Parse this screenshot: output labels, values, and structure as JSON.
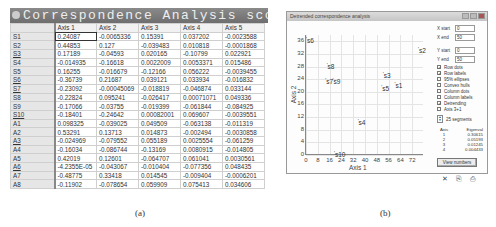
{
  "panel_a": {
    "title": "Correspondence Analysis scores",
    "columns": [
      "",
      "Axis 1",
      "Axis 2",
      "Axis 3",
      "Axis 4",
      "Axis 5"
    ],
    "rows": [
      {
        "label": "S1",
        "values": [
          "0.24087",
          "-0.0065336",
          "0.15391",
          "0.037202",
          "-0.0023588"
        ]
      },
      {
        "label": "S2",
        "values": [
          "0.44853",
          "0.127",
          "-0.039483",
          "0.010818",
          "-0.0001868"
        ]
      },
      {
        "label": "S3",
        "values": [
          "0.17189",
          "-0.04593",
          "0.020165",
          "-0.10799",
          "0.022921"
        ]
      },
      {
        "label": "S4",
        "values": [
          "-0.014935",
          "-0.16618",
          "0.0022009",
          "0.0053371",
          "0.015486"
        ]
      },
      {
        "label": "S5",
        "values": [
          "0.16255",
          "-0.016679",
          "-0.12166",
          "0.056222",
          "-0.0039455"
        ]
      },
      {
        "label": "S6",
        "values": [
          "-0.36739",
          "0.21687",
          "0.039121",
          "0.033934",
          "-0.016832"
        ]
      },
      {
        "label": "S7",
        "values": [
          "-0.23092",
          "-0.00045069",
          "-0.018819",
          "-0.046874",
          "0.033144"
        ]
      },
      {
        "label": "S8",
        "values": [
          "-0.22824",
          "0.095241",
          "-0.026417",
          "0.00071071",
          "0.049336"
        ]
      },
      {
        "label": "S9",
        "values": [
          "-0.17066",
          "-0.03755",
          "-0.019399",
          "-0.061844",
          "-0.084925"
        ]
      },
      {
        "label": "S10",
        "values": [
          "-0.18401",
          "-0.24642",
          "0.00082001",
          "0.069607",
          "-0.0039551"
        ]
      },
      {
        "label": "A1",
        "values": [
          "0.098325",
          "-0.039025",
          "0.049509",
          "-0.063138",
          "-0.011319"
        ]
      },
      {
        "label": "A2",
        "values": [
          "0.53291",
          "0.13713",
          "0.014873",
          "-0.002494",
          "-0.0030858"
        ]
      },
      {
        "label": "A3",
        "values": [
          "-0.024969",
          "-0.079552",
          "0.055189",
          "0.0025554",
          "-0.061259"
        ]
      },
      {
        "label": "A4",
        "values": [
          "-0.16034",
          "-0.086744",
          "-0.13169",
          "0.0080915",
          "-0.014805"
        ]
      },
      {
        "label": "A5",
        "values": [
          "0.42019",
          "0.12601",
          "-0.064707",
          "0.061041",
          "0.0030561"
        ]
      },
      {
        "label": "A6",
        "values": [
          "-4.2355E-05",
          "-0.043067",
          "-0.010404",
          "-0.077356",
          "0.048435"
        ]
      },
      {
        "label": "A7",
        "values": [
          "-0.48775",
          "0.33418",
          "0.014545",
          "-0.009404",
          "-0.0006201"
        ]
      },
      {
        "label": "A8",
        "values": [
          "-0.11902",
          "-0.078654",
          "0.059909",
          "0.075413",
          "0.034606"
        ]
      }
    ],
    "caption": "(a)"
  },
  "panel_b": {
    "title": "Detrended correspondence analysis",
    "controls": {
      "x_start_label": "X start",
      "x_start": "0",
      "x_end_label": "X end",
      "x_end": "50",
      "y_start_label": "Y start",
      "y_start": "0",
      "y_end_label": "Y end",
      "y_end": "50",
      "checkboxes": [
        {
          "label": "Row dots",
          "checked": true
        },
        {
          "label": "Row labels",
          "checked": true
        },
        {
          "label": "95% ellipses",
          "checked": false
        },
        {
          "label": "Convex hulls",
          "checked": false
        },
        {
          "label": "Column dots",
          "checked": false
        },
        {
          "label": "Column labels",
          "checked": false
        },
        {
          "label": "Detrending",
          "checked": true
        },
        {
          "label": "Axis 3+1",
          "checked": false
        }
      ],
      "segments_label": "25 segments",
      "eigen_header": [
        "Axis",
        "Eigenval"
      ],
      "eigen_rows": [
        [
          "1",
          "0.30615"
        ],
        [
          "2",
          "0.05193"
        ],
        [
          "3",
          "0.01245"
        ],
        [
          "4",
          "0.004433"
        ]
      ],
      "view_button": "View numbers",
      "tools": [
        "close-x",
        "copy",
        "print"
      ]
    },
    "caption": "(b)"
  },
  "chart_data": {
    "type": "scatter",
    "title": "Detrended correspondence analysis",
    "xlabel": "Axis 1",
    "ylabel": "Axis 2",
    "x_ticks": [
      "0",
      "8",
      "16",
      "24",
      "32",
      "40",
      "48",
      "56",
      "64",
      "72"
    ],
    "y_ticks": [
      "0",
      "4",
      "8",
      "12",
      "16",
      "20",
      "24",
      "28",
      "32",
      "36"
    ],
    "xlim": [
      0,
      80
    ],
    "ylim": [
      0,
      38
    ],
    "grid": true,
    "points": [
      {
        "label": "s1",
        "x": 60,
        "y": 22
      },
      {
        "label": "s2",
        "x": 76,
        "y": 33
      },
      {
        "label": "s3",
        "x": 52,
        "y": 25
      },
      {
        "label": "s4",
        "x": 35,
        "y": 10
      },
      {
        "label": "s5",
        "x": 51,
        "y": 21
      },
      {
        "label": "s6",
        "x": 0,
        "y": 36
      },
      {
        "label": "s7",
        "x": 13,
        "y": 23
      },
      {
        "label": "s8",
        "x": 14,
        "y": 28
      },
      {
        "label": "s9",
        "x": 18,
        "y": 23
      },
      {
        "label": "s10",
        "x": 19,
        "y": 0
      }
    ]
  }
}
